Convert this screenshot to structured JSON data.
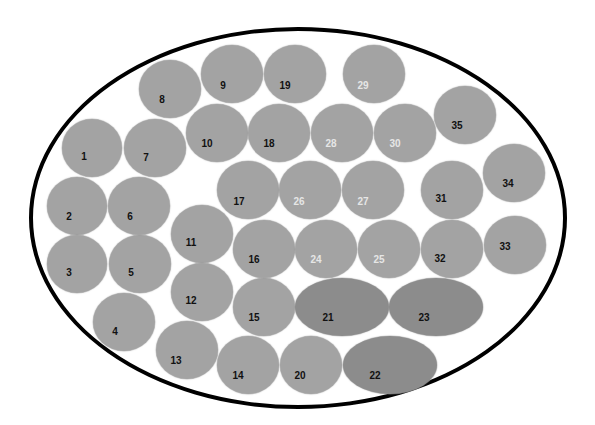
{
  "diagram": {
    "outline": {
      "shape": "ellipse",
      "cx": 297,
      "cy": 216,
      "rx": 266,
      "ry": 188,
      "stroke": "#000000"
    },
    "colors": {
      "light_cell": "#a3a3a3",
      "dark_cell": "#8c8c8c",
      "label_dark": "#111111",
      "label_light": "#e6e6e6"
    },
    "cells": [
      {
        "label": "1",
        "cx": 92,
        "cy": 148,
        "w": 60,
        "h": 58,
        "tone": "light",
        "text": "dark",
        "dx": -8,
        "dy": 8
      },
      {
        "label": "2",
        "cx": 77,
        "cy": 206,
        "w": 60,
        "h": 58,
        "tone": "light",
        "text": "dark",
        "dx": -8,
        "dy": 10
      },
      {
        "label": "3",
        "cx": 77,
        "cy": 264,
        "w": 60,
        "h": 58,
        "tone": "light",
        "text": "dark",
        "dx": -8,
        "dy": 8
      },
      {
        "label": "4",
        "cx": 124,
        "cy": 322,
        "w": 62,
        "h": 58,
        "tone": "light",
        "text": "dark",
        "dx": -9,
        "dy": 9
      },
      {
        "label": "5",
        "cx": 140,
        "cy": 264,
        "w": 62,
        "h": 58,
        "tone": "light",
        "text": "dark",
        "dx": -9,
        "dy": 8
      },
      {
        "label": "6",
        "cx": 139,
        "cy": 206,
        "w": 62,
        "h": 58,
        "tone": "light",
        "text": "dark",
        "dx": -9,
        "dy": 10
      },
      {
        "label": "7",
        "cx": 155,
        "cy": 148,
        "w": 62,
        "h": 58,
        "tone": "light",
        "text": "dark",
        "dx": -9,
        "dy": 9
      },
      {
        "label": "8",
        "cx": 170,
        "cy": 89,
        "w": 62,
        "h": 58,
        "tone": "light",
        "text": "dark",
        "dx": -8,
        "dy": 10
      },
      {
        "label": "9",
        "cx": 232,
        "cy": 74,
        "w": 62,
        "h": 58,
        "tone": "light",
        "text": "dark",
        "dx": -9,
        "dy": 11
      },
      {
        "label": "10",
        "cx": 217,
        "cy": 133,
        "w": 62,
        "h": 58,
        "tone": "light",
        "text": "dark",
        "dx": -10,
        "dy": 10
      },
      {
        "label": "11",
        "cx": 202,
        "cy": 234,
        "w": 62,
        "h": 58,
        "tone": "light",
        "text": "dark",
        "dx": -11,
        "dy": 8
      },
      {
        "label": "12",
        "cx": 202,
        "cy": 292,
        "w": 62,
        "h": 58,
        "tone": "light",
        "text": "dark",
        "dx": -11,
        "dy": 8
      },
      {
        "label": "13",
        "cx": 187,
        "cy": 350,
        "w": 62,
        "h": 58,
        "tone": "light",
        "text": "dark",
        "dx": -11,
        "dy": 10
      },
      {
        "label": "14",
        "cx": 248,
        "cy": 365,
        "w": 62,
        "h": 58,
        "tone": "light",
        "text": "dark",
        "dx": -10,
        "dy": 10
      },
      {
        "label": "15",
        "cx": 264,
        "cy": 307,
        "w": 62,
        "h": 58,
        "tone": "light",
        "text": "dark",
        "dx": -10,
        "dy": 10
      },
      {
        "label": "16",
        "cx": 264,
        "cy": 249,
        "w": 62,
        "h": 58,
        "tone": "light",
        "text": "dark",
        "dx": -10,
        "dy": 10
      },
      {
        "label": "17",
        "cx": 248,
        "cy": 190,
        "w": 62,
        "h": 58,
        "tone": "light",
        "text": "dark",
        "dx": -9,
        "dy": 11
      },
      {
        "label": "18",
        "cx": 279,
        "cy": 133,
        "w": 62,
        "h": 58,
        "tone": "light",
        "text": "dark",
        "dx": -10,
        "dy": 10
      },
      {
        "label": "19",
        "cx": 295,
        "cy": 74,
        "w": 62,
        "h": 58,
        "tone": "light",
        "text": "dark",
        "dx": -10,
        "dy": 11
      },
      {
        "label": "20",
        "cx": 311,
        "cy": 365,
        "w": 62,
        "h": 58,
        "tone": "light",
        "text": "dark",
        "dx": -11,
        "dy": 10
      },
      {
        "label": "21",
        "cx": 342,
        "cy": 307,
        "w": 94,
        "h": 58,
        "tone": "dark",
        "text": "dark",
        "dx": -14,
        "dy": 10
      },
      {
        "label": "22",
        "cx": 390,
        "cy": 365,
        "w": 94,
        "h": 58,
        "tone": "dark",
        "text": "dark",
        "dx": -15,
        "dy": 10
      },
      {
        "label": "23",
        "cx": 436,
        "cy": 307,
        "w": 94,
        "h": 58,
        "tone": "dark",
        "text": "dark",
        "dx": -12,
        "dy": 10
      },
      {
        "label": "24",
        "cx": 326,
        "cy": 249,
        "w": 62,
        "h": 58,
        "tone": "light",
        "text": "light",
        "dx": -10,
        "dy": 10
      },
      {
        "label": "25",
        "cx": 389,
        "cy": 249,
        "w": 62,
        "h": 58,
        "tone": "light",
        "text": "light",
        "dx": -10,
        "dy": 10
      },
      {
        "label": "26",
        "cx": 310,
        "cy": 190,
        "w": 62,
        "h": 58,
        "tone": "light",
        "text": "light",
        "dx": -11,
        "dy": 11
      },
      {
        "label": "27",
        "cx": 373,
        "cy": 190,
        "w": 62,
        "h": 58,
        "tone": "light",
        "text": "light",
        "dx": -10,
        "dy": 11
      },
      {
        "label": "28",
        "cx": 342,
        "cy": 133,
        "w": 62,
        "h": 58,
        "tone": "light",
        "text": "light",
        "dx": -11,
        "dy": 10
      },
      {
        "label": "29",
        "cx": 374,
        "cy": 74,
        "w": 62,
        "h": 58,
        "tone": "light",
        "text": "light",
        "dx": -11,
        "dy": 11
      },
      {
        "label": "30",
        "cx": 405,
        "cy": 133,
        "w": 62,
        "h": 58,
        "tone": "light",
        "text": "light",
        "dx": -10,
        "dy": 10
      },
      {
        "label": "31",
        "cx": 452,
        "cy": 190,
        "w": 62,
        "h": 58,
        "tone": "light",
        "text": "dark",
        "dx": -11,
        "dy": 8
      },
      {
        "label": "32",
        "cx": 452,
        "cy": 249,
        "w": 62,
        "h": 58,
        "tone": "light",
        "text": "dark",
        "dx": -12,
        "dy": 9
      },
      {
        "label": "33",
        "cx": 515,
        "cy": 245,
        "w": 62,
        "h": 58,
        "tone": "light",
        "text": "dark",
        "dx": -10,
        "dy": 1
      },
      {
        "label": "34",
        "cx": 514,
        "cy": 173,
        "w": 62,
        "h": 58,
        "tone": "light",
        "text": "dark",
        "dx": -6,
        "dy": 10
      },
      {
        "label": "35",
        "cx": 465,
        "cy": 115,
        "w": 62,
        "h": 58,
        "tone": "light",
        "text": "dark",
        "dx": -8,
        "dy": 10
      }
    ]
  }
}
